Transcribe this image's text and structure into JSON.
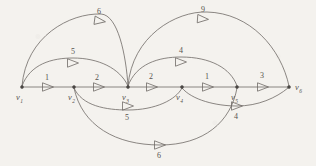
{
  "figure": {
    "kind": "directed-weighted-graph",
    "style": "hand-drawn pencil sketch on off-white paper",
    "background_color": "#f4f2ee",
    "ink_color": "#6e6a66"
  },
  "nodes": [
    {
      "id": "v1",
      "label": "v",
      "sub": "1",
      "x": 22,
      "y": 87,
      "label_x": 16,
      "label_y": 100
    },
    {
      "id": "v2",
      "label": "v",
      "sub": "2",
      "x": 74,
      "y": 87,
      "label_x": 68,
      "label_y": 100
    },
    {
      "id": "v3",
      "label": "v",
      "sub": "3",
      "x": 128,
      "y": 87,
      "label_x": 122,
      "label_y": 100
    },
    {
      "id": "v4",
      "label": "v",
      "sub": "4",
      "x": 182,
      "y": 87,
      "label_x": 176,
      "label_y": 100
    },
    {
      "id": "v5",
      "label": "v",
      "sub": "5",
      "x": 237,
      "y": 87,
      "label_x": 231,
      "label_y": 100
    },
    {
      "id": "v6",
      "label": "v",
      "sub": "6",
      "x": 289,
      "y": 87,
      "label_x": 295,
      "label_y": 90
    }
  ],
  "edges": [
    {
      "id": "e-v1-v2",
      "from": "v1",
      "to": "v2",
      "weight": "1",
      "path": "M 23 87 L 73 87",
      "arrow": {
        "x": 48,
        "y": 87,
        "angle": 0
      },
      "label_x": 47,
      "label_y": 80
    },
    {
      "id": "e-v2-v3",
      "from": "v2",
      "to": "v3",
      "weight": "2",
      "path": "M 75 87 L 127 87",
      "arrow": {
        "x": 99,
        "y": 87,
        "angle": 0
      },
      "label_x": 97,
      "label_y": 80
    },
    {
      "id": "e-v3-v4",
      "from": "v3",
      "to": "v4",
      "weight": "2",
      "path": "M 129 87 L 181 87",
      "arrow": {
        "x": 152,
        "y": 87,
        "angle": 0
      },
      "label_x": 151,
      "label_y": 79
    },
    {
      "id": "e-v4-v5",
      "from": "v4",
      "to": "v5",
      "weight": "1",
      "path": "M 183 87 L 236 87",
      "arrow": {
        "x": 208,
        "y": 87,
        "angle": 0
      },
      "label_x": 207,
      "label_y": 79
    },
    {
      "id": "e-v5-v6",
      "from": "v5",
      "to": "v6",
      "weight": "3",
      "path": "M 238 87 L 288 87",
      "arrow": {
        "x": 263,
        "y": 87,
        "angle": 0
      },
      "label_x": 262,
      "label_y": 78
    },
    {
      "id": "e-v1-v3-top",
      "from": "v1",
      "to": "v3",
      "weight": "6",
      "path": "M 22 86 C 26 36, 70 13, 101 14 C 118 15, 126 55, 128 86",
      "arrow": {
        "x": 100,
        "y": 21,
        "angle": 8
      },
      "label_x": 99,
      "label_y": 14
    },
    {
      "id": "e-v3-v6-top",
      "from": "v3",
      "to": "v6",
      "weight": "9",
      "path": "M 128 86 C 132 36, 176 11, 207 12 C 250 13, 281 48, 289 86",
      "arrow": {
        "x": 203,
        "y": 19,
        "angle": 4
      },
      "label_x": 203,
      "label_y": 12
    },
    {
      "id": "e-v1-v3-upper",
      "from": "v1",
      "to": "v3",
      "weight": "5",
      "path": "M 22 86 C 30 64, 52 58, 73 58 C 98 58, 120 68, 128 86",
      "arrow": {
        "x": 73,
        "y": 63,
        "angle": 0
      },
      "label_x": 73,
      "label_y": 54
    },
    {
      "id": "e-v3-v5-upper",
      "from": "v3",
      "to": "v5",
      "weight": "4",
      "path": "M 128 86 C 136 64, 158 57, 181 57 C 210 57, 231 68, 237 86",
      "arrow": {
        "x": 181,
        "y": 62,
        "angle": 0
      },
      "label_x": 181,
      "label_y": 53
    },
    {
      "id": "e-v2-v4-lower",
      "from": "v2",
      "to": "v4",
      "weight": "5",
      "path": "M 74 88 C 82 106, 106 110, 128 110 C 155 110, 176 100, 182 88",
      "arrow": {
        "x": 128,
        "y": 106,
        "angle": 0
      },
      "label_x": 127,
      "label_y": 120
    },
    {
      "id": "e-v2-v5-bottom",
      "from": "v2",
      "to": "v5",
      "weight": "6",
      "path": "M 74 88 C 82 126, 116 145, 160 145 C 204 145, 231 122, 237 88",
      "arrow": {
        "x": 160,
        "y": 145,
        "angle": 0
      },
      "label_x": 159,
      "label_y": 158
    },
    {
      "id": "e-v4-v5-lower",
      "from": "v4",
      "to": "v5",
      "weight": "4",
      "path": "M 182 88 C 192 100, 216 106, 237 106 C 258 106, 276 98, 288 88",
      "arrow": {
        "x": 237,
        "y": 106,
        "angle": 0
      },
      "label_x": 236,
      "label_y": 119
    }
  ]
}
